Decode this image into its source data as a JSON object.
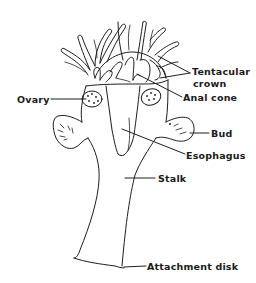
{
  "diagram": {
    "labels": {
      "tentacular_crown_line1": "Tentacular",
      "tentacular_crown_line2": "crown",
      "anal_cone": "Anal cone",
      "ovary": "Ovary",
      "bud": "Bud",
      "esophagus": "Esophagus",
      "stalk": "Stalk",
      "attachment_disk": "Attachment disk"
    },
    "colors": {
      "line": "#1e1e1e",
      "text": "#1a1a1a",
      "background": "#ffffff"
    }
  }
}
